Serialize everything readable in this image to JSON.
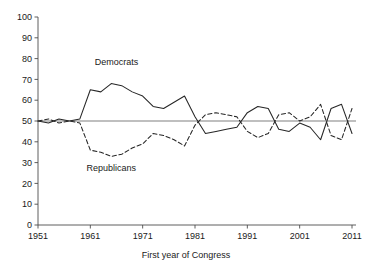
{
  "chart_data": {
    "type": "line",
    "title": "",
    "xlabel": "First year of Congress",
    "ylabel": "",
    "xlim": [
      1951,
      2011
    ],
    "ylim": [
      0,
      100
    ],
    "grid": false,
    "legend_position": "inline-annotations",
    "xticks": [
      1951,
      1961,
      1971,
      1981,
      1991,
      2001,
      2011
    ],
    "xtick_labels": [
      "1951",
      "1961",
      "1971",
      "1981",
      "1991",
      "2001",
      "2011"
    ],
    "yticks": [
      0,
      10,
      20,
      30,
      40,
      50,
      60,
      70,
      80,
      90,
      100
    ],
    "ytick_labels": [
      "0",
      "10",
      "20",
      "30",
      "40",
      "50",
      "60",
      "70",
      "80",
      "90",
      "100"
    ],
    "reference_line": 50,
    "annotations": [
      {
        "text": "Democrats",
        "x": 1966,
        "y": 77
      },
      {
        "text": "Republicans",
        "x": 1965,
        "y": 26
      }
    ],
    "x": [
      1951,
      1953,
      1955,
      1957,
      1959,
      1961,
      1963,
      1965,
      1967,
      1969,
      1971,
      1973,
      1975,
      1977,
      1979,
      1981,
      1983,
      1985,
      1987,
      1989,
      1991,
      1993,
      1995,
      1997,
      1999,
      2001,
      2003,
      2005,
      2007,
      2009,
      2011
    ],
    "series": [
      {
        "name": "Democrats",
        "style": "solid",
        "color": "#262626",
        "values": [
          50,
          49,
          51,
          50,
          51,
          65,
          64,
          68,
          67,
          64,
          62,
          57,
          56,
          59,
          62,
          52,
          44,
          45,
          46,
          47,
          54,
          57,
          56,
          46,
          45,
          49,
          47,
          41,
          56,
          58,
          44
        ]
      },
      {
        "name": "Republicans",
        "style": "dashed",
        "color": "#262626",
        "values": [
          50,
          51,
          49,
          50,
          49,
          36,
          35,
          33,
          34,
          37,
          39,
          44,
          43,
          41,
          38,
          48,
          53,
          54,
          53,
          52,
          45,
          42,
          44,
          53,
          54,
          50,
          52,
          58,
          43,
          41,
          56
        ]
      }
    ]
  }
}
